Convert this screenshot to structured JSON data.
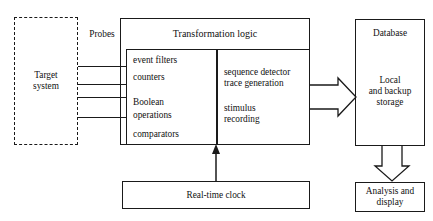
{
  "diagram": {
    "background_color": "#ffffff",
    "line_color": "#1a1a1a",
    "nodes": {
      "target_system": {
        "label": "Target\nsystem",
        "style": "dashed",
        "x": 14,
        "y": 17,
        "w": 64,
        "h": 128
      },
      "probes": {
        "label": "Probes",
        "style": "text-only",
        "x": 82,
        "y": 27,
        "w": 38,
        "h": 14
      },
      "transformation_logic": {
        "label": "Transformation logic",
        "style": "solid",
        "x": 120,
        "y": 18,
        "w": 190,
        "h": 127
      },
      "left_functions": {
        "label": "event filters\ncounters\n\nBoolean\noperations\n\ncomparators",
        "lines": [
          "event filters",
          "counters",
          "Boolean",
          "operations",
          "comparators"
        ],
        "style": "solid",
        "x": 126,
        "y": 49,
        "w": 91,
        "h": 96
      },
      "right_functions": {
        "label": "sequence detector\ntrace generation\n\nstimulus\nrecording",
        "lines": [
          "sequence detector",
          "trace generation",
          "stimulus",
          "recording"
        ],
        "style": "solid",
        "x": 217,
        "y": 49,
        "w": 93,
        "h": 96
      },
      "database": {
        "label": "Database",
        "sub_label": "Local\nand backup\nstorage",
        "style": "solid",
        "x": 355,
        "y": 19,
        "w": 70,
        "h": 127
      },
      "real_time_clock": {
        "label": "Real-time clock",
        "style": "solid",
        "x": 122,
        "y": 181,
        "w": 188,
        "h": 28
      },
      "analysis_display": {
        "label": "Analysis and\ndisplay",
        "style": "solid",
        "x": 355,
        "y": 182,
        "w": 70,
        "h": 30
      }
    },
    "connections": {
      "probe_lines_count": 4,
      "probe_lines_y": [
        66,
        84,
        97,
        117
      ],
      "probe_line_x_start": 78,
      "probe_line_x_end": 126,
      "logic_to_database_arrow": "block-arrow-right",
      "database_to_analysis_arrow": "block-arrow-down",
      "clock_to_logic_arrow": "thin-arrow-up"
    }
  }
}
